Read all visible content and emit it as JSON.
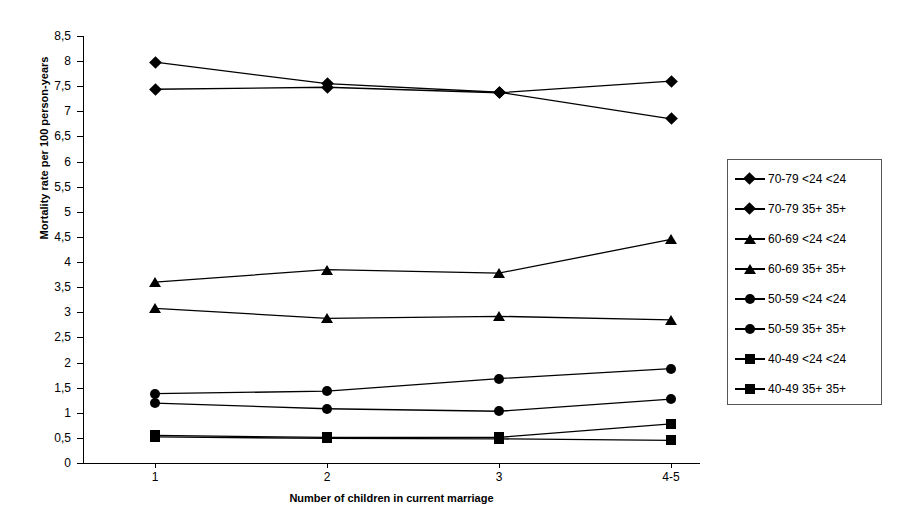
{
  "chart_data": {
    "type": "line",
    "title": "",
    "xlabel": "Number of children in current marriage",
    "ylabel": "Mortality rate per 100 person-years",
    "categories": [
      "1",
      "2",
      "3",
      "4-5"
    ],
    "ylim": [
      0,
      8.5
    ],
    "yticks": [
      "0",
      "0,5",
      "1",
      "1,5",
      "2",
      "2,5",
      "3",
      "3,5",
      "4",
      "4,5",
      "5",
      "5,5",
      "6",
      "6,5",
      "7",
      "7,5",
      "8",
      "8,5"
    ],
    "ytick_values": [
      0,
      0.5,
      1,
      1.5,
      2,
      2.5,
      3,
      3.5,
      4,
      4.5,
      5,
      5.5,
      6,
      6.5,
      7,
      7.5,
      8,
      8.5
    ],
    "grid": false,
    "legend_position": "right",
    "series": [
      {
        "name": "70-79 <24 <24",
        "marker": "diamond",
        "values": [
          7.98,
          7.55,
          7.38,
          6.85
        ]
      },
      {
        "name": "70-79 35+ 35+",
        "marker": "diamond",
        "values": [
          7.44,
          7.48,
          7.37,
          7.6
        ]
      },
      {
        "name": "60-69 <24 <24",
        "marker": "triangle",
        "values": [
          3.6,
          3.85,
          3.78,
          4.45
        ]
      },
      {
        "name": "60-69 35+ 35+",
        "marker": "triangle",
        "values": [
          3.08,
          2.88,
          2.92,
          2.85
        ]
      },
      {
        "name": "50-59 <24 <24",
        "marker": "circle",
        "values": [
          1.38,
          1.43,
          1.68,
          1.88
        ]
      },
      {
        "name": "50-59 35+ 35+",
        "marker": "circle",
        "values": [
          1.19,
          1.08,
          1.03,
          1.27
        ]
      },
      {
        "name": "40-49 <24 <24",
        "marker": "square",
        "values": [
          0.55,
          0.51,
          0.51,
          0.78
        ]
      },
      {
        "name": "40-49 35+ 35+",
        "marker": "square",
        "values": [
          0.52,
          0.49,
          0.48,
          0.45
        ]
      }
    ]
  },
  "legend": {
    "items": [
      {
        "label": "70-79 <24 <24",
        "marker": "diamond"
      },
      {
        "label": "70-79 35+ 35+",
        "marker": "diamond"
      },
      {
        "label": "60-69 <24 <24",
        "marker": "triangle"
      },
      {
        "label": "60-69 35+ 35+",
        "marker": "triangle"
      },
      {
        "label": "50-59 <24 <24",
        "marker": "circle"
      },
      {
        "label": "50-59 35+ 35+",
        "marker": "circle"
      },
      {
        "label": "40-49 <24 <24",
        "marker": "square"
      },
      {
        "label": "40-49 35+ 35+",
        "marker": "square"
      }
    ]
  },
  "colors": {
    "series": "#000000",
    "axis": "#000000",
    "legend_border": "#555555",
    "background": "#ffffff"
  }
}
